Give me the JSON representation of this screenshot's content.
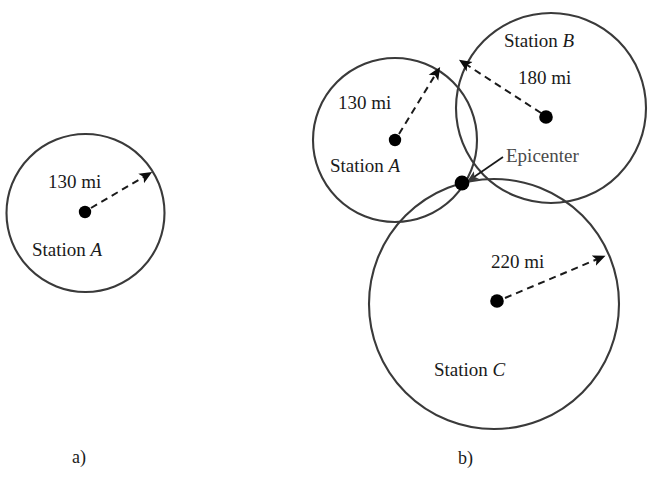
{
  "figure": {
    "background_color": "#ffffff",
    "stroke_color": "#3a3a3a",
    "dot_color": "#000000",
    "width": 657,
    "height": 490
  },
  "panel_a": {
    "letter": "a)",
    "distance_label": "130 mi",
    "station_label_prefix": "Station ",
    "station_label_italic": "A",
    "circle": {
      "cx": 85.5,
      "cy": 213,
      "r": 79
    },
    "center_dot": {
      "x": 85,
      "y": 212
    },
    "arrow_tip": {
      "x": 149,
      "y": 173
    }
  },
  "panel_b": {
    "letter": "b)",
    "epicenter_label": "Epicenter",
    "epicenter_dot": {
      "x": 462,
      "y": 183
    },
    "stations": [
      {
        "name": "A",
        "label_prefix": "Station ",
        "label_italic": "A",
        "distance_label": "130 mi",
        "distance_value": 130,
        "unit": "mi",
        "circle": {
          "cx": 395,
          "cy": 140,
          "r": 82
        },
        "center_dot": {
          "x": 395,
          "y": 140
        },
        "arrow_tip": {
          "x": 438,
          "y": 70
        }
      },
      {
        "name": "B",
        "label_prefix": "Station ",
        "label_italic": "B",
        "distance_label": "180 mi",
        "distance_value": 180,
        "unit": "mi",
        "circle": {
          "cx": 551,
          "cy": 108,
          "r": 95
        },
        "center_dot": {
          "x": 546,
          "y": 117
        },
        "arrow_tip": {
          "x": 462,
          "y": 61
        }
      },
      {
        "name": "C",
        "label_prefix": "Station ",
        "label_italic": "C",
        "distance_label": "220 mi",
        "distance_value": 220,
        "unit": "mi",
        "circle": {
          "cx": 494,
          "cy": 304,
          "r": 125
        },
        "center_dot": {
          "x": 497,
          "y": 301
        },
        "arrow_tip": {
          "x": 602,
          "y": 256
        }
      }
    ]
  }
}
